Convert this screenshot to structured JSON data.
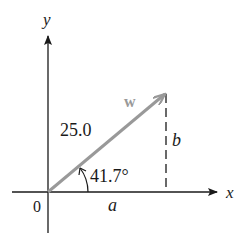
{
  "diagram": {
    "type": "vector-components",
    "axes": {
      "x_label": "x",
      "y_label": "y",
      "origin_label": "0"
    },
    "vector": {
      "name": "w",
      "magnitude_label": "25.0",
      "angle_label": "41.7°",
      "color": "#999999"
    },
    "components": {
      "horizontal_label": "a",
      "vertical_label": "b"
    },
    "colors": {
      "axis": "#1a1a1a",
      "vector": "#999999",
      "dashed": "#1a1a1a",
      "background": "#ffffff"
    }
  }
}
